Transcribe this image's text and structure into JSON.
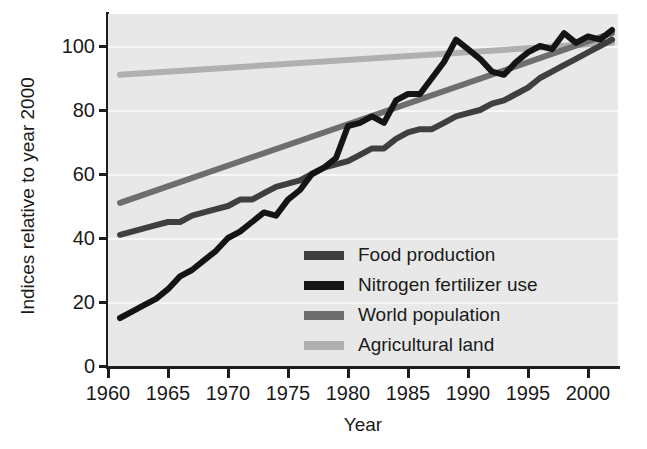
{
  "chart_data": {
    "type": "line",
    "title": "",
    "xlabel": "Year",
    "ylabel": "Indices relative to year 2000",
    "xlim": [
      1960,
      2002.5
    ],
    "ylim": [
      0,
      110
    ],
    "xticks": [
      "1960",
      "1965",
      "1970",
      "1975",
      "1980",
      "1985",
      "1990",
      "1995",
      "2000"
    ],
    "xtick_values": [
      1960,
      1965,
      1970,
      1975,
      1980,
      1985,
      1990,
      1995,
      2000
    ],
    "yticks": [
      "0",
      "20",
      "40",
      "60",
      "80",
      "100"
    ],
    "ytick_values": [
      0,
      20,
      40,
      60,
      80,
      100
    ],
    "grid": "horizontal",
    "legend_position": "inside-lower-center",
    "plot_background": "#e8e8e8",
    "gridline_color": "#f7f7f7",
    "axis_color": "#1d1d1d",
    "series": [
      {
        "name": "Food production",
        "color": "#3f3f3f",
        "x": [
          1961,
          1962,
          1963,
          1964,
          1965,
          1966,
          1967,
          1968,
          1969,
          1970,
          1971,
          1972,
          1973,
          1974,
          1975,
          1976,
          1977,
          1978,
          1979,
          1980,
          1981,
          1982,
          1983,
          1984,
          1985,
          1986,
          1987,
          1988,
          1989,
          1990,
          1991,
          1992,
          1993,
          1994,
          1995,
          1996,
          1997,
          1998,
          1999,
          2000,
          2001,
          2002
        ],
        "values": [
          41,
          42,
          43,
          44,
          45,
          45,
          47,
          48,
          49,
          50,
          52,
          52,
          54,
          56,
          57,
          58,
          60,
          62,
          63,
          64,
          66,
          68,
          68,
          71,
          73,
          74,
          74,
          76,
          78,
          79,
          80,
          82,
          83,
          85,
          87,
          90,
          92,
          94,
          96,
          98,
          100,
          102
        ]
      },
      {
        "name": "Nitrogen fertilizer use",
        "color": "#141414",
        "x": [
          1961,
          1962,
          1963,
          1964,
          1965,
          1966,
          1967,
          1968,
          1969,
          1970,
          1971,
          1972,
          1973,
          1974,
          1975,
          1976,
          1977,
          1978,
          1979,
          1980,
          1981,
          1982,
          1983,
          1984,
          1985,
          1986,
          1987,
          1988,
          1989,
          1990,
          1991,
          1992,
          1993,
          1994,
          1995,
          1996,
          1997,
          1998,
          1999,
          2000,
          2001,
          2002
        ],
        "values": [
          15,
          17,
          19,
          21,
          24,
          28,
          30,
          33,
          36,
          40,
          42,
          45,
          48,
          47,
          52,
          55,
          60,
          62,
          65,
          75,
          76,
          78,
          76,
          83,
          85,
          85,
          90,
          95,
          102,
          99,
          96,
          92,
          91,
          95,
          98,
          100,
          99,
          104,
          101,
          103,
          102,
          105
        ]
      },
      {
        "name": "World population",
        "color": "#6e6e6e",
        "x": [
          1961,
          2002
        ],
        "values": [
          51,
          104
        ]
      },
      {
        "name": "Agricultural land",
        "color": "#b0b0b0",
        "x": [
          1961,
          2002
        ],
        "values": [
          91,
          101
        ]
      }
    ]
  },
  "legend": {
    "items": [
      {
        "label": "Food production",
        "color": "#3f3f3f"
      },
      {
        "label": "Nitrogen fertilizer use",
        "color": "#141414"
      },
      {
        "label": "World population",
        "color": "#6e6e6e"
      },
      {
        "label": "Agricultural land",
        "color": "#b0b0b0"
      }
    ]
  }
}
